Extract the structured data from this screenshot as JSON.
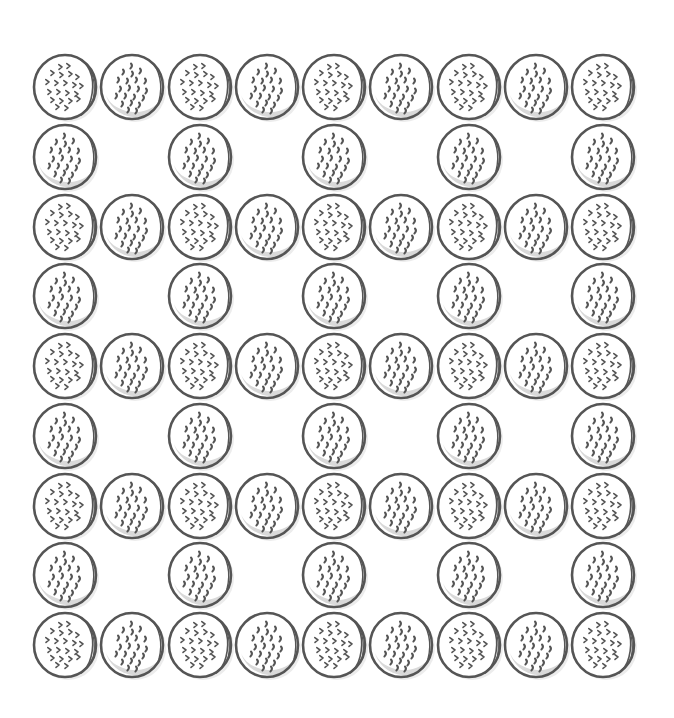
{
  "scene": {
    "description": "Line-drawing illustration of round crackers arranged in a 9x9 lattice pattern",
    "background": "#ffffff",
    "outline_color": "#555555",
    "shade_color": "#d9d9d9",
    "shadow_color": "#ececec",
    "grid": {
      "columns": 9,
      "rows": 9,
      "origin_x": 65,
      "origin_y": 87,
      "col_step": 67.25,
      "row_step": 69.75,
      "cookie_diameter": 64
    },
    "rows": [
      "AB AB AB AB A",
      "B.B.B.B.B",
      "ABABABABA",
      "B.B.B.B.B",
      "ABABABABA",
      "B.B.B.B.B",
      "ABABABABA",
      "B.B.B.B.B",
      "ABABABABA"
    ],
    "cookie_count": 65,
    "cookie_types": {
      "A": "cracker-chevron-pattern",
      "B": "cracker-shaded-dots"
    }
  }
}
